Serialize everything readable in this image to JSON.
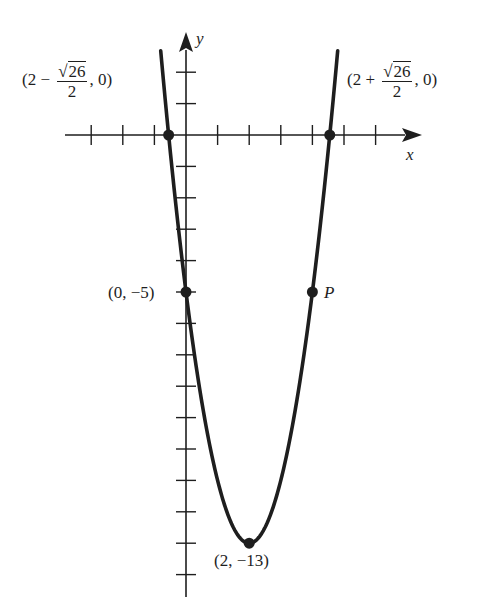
{
  "chart_data": {
    "type": "line",
    "title": "",
    "function": "y = 2x^2 - 8x - 5",
    "xlabel": "x",
    "ylabel": "y",
    "grid": false,
    "legend": null,
    "x_range": [
      -3,
      6
    ],
    "y_range": [
      -14,
      2
    ],
    "x_ticks": [
      -3,
      -2,
      -1,
      1,
      2,
      3,
      4,
      5,
      6
    ],
    "y_ticks": [
      2,
      1,
      -1,
      -2,
      -3,
      -4,
      -5,
      -6,
      -7,
      -8,
      -9,
      -10,
      -11,
      -12,
      -13,
      -14
    ],
    "labeled_points": [
      {
        "name": "left_root",
        "x": -0.5495,
        "y": 0,
        "label": "(2 − √26/2, 0)"
      },
      {
        "name": "right_root",
        "x": 4.5495,
        "y": 0,
        "label": "(2 + √26/2, 0)"
      },
      {
        "name": "y_intercept",
        "x": 0,
        "y": -5,
        "label": "(0, −5)"
      },
      {
        "name": "P",
        "x": 4,
        "y": -5,
        "label": "P"
      },
      {
        "name": "vertex",
        "x": 2,
        "y": -13,
        "label": "(2, −13)"
      }
    ]
  },
  "labels": {
    "axis_x": "x",
    "axis_y": "y",
    "left_root": {
      "open": "(2 −",
      "num": "26",
      "den": "2",
      "close": ", 0)"
    },
    "right_root": {
      "open": "(2 +",
      "num": "26",
      "den": "2",
      "close": ", 0)"
    },
    "y_intercept": "(0, −5)",
    "point_p": "P",
    "vertex": "(2, −13)",
    "sqrt_symbol": "√"
  },
  "colors": {
    "ink": "#1e1e1e",
    "background": "#ffffff"
  }
}
